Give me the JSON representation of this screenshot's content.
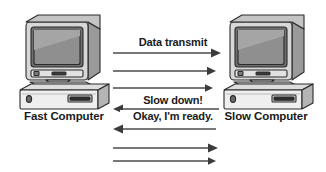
{
  "diagram": {
    "width": 326,
    "height": 172,
    "background_color": "#ffffff",
    "line_color": "#4a4a4a",
    "text_color": "#1a1a1a"
  },
  "nodes": [
    {
      "id": "fast-computer",
      "label": "Fast Computer",
      "icon": "desktop-computer-icon",
      "side": "left"
    },
    {
      "id": "slow-computer",
      "label": "Slow Computer",
      "icon": "desktop-computer-icon",
      "side": "right"
    }
  ],
  "messages": [
    {
      "id": "msg-1",
      "label": "Data transmit",
      "direction": "right",
      "y": 53
    },
    {
      "id": "msg-2",
      "label": "",
      "direction": "right",
      "y": 71
    },
    {
      "id": "msg-3",
      "label": "",
      "direction": "right",
      "y": 88
    },
    {
      "id": "msg-4",
      "label": "Slow down!",
      "direction": "left",
      "y": 109
    },
    {
      "id": "msg-5",
      "label": "Okay, I'm ready.",
      "direction": "left",
      "y": 129
    },
    {
      "id": "msg-6",
      "label": "",
      "direction": "right",
      "y": 148
    },
    {
      "id": "msg-7",
      "label": "",
      "direction": "right",
      "y": 161
    }
  ],
  "labels": {
    "data_transmit": "Data transmit",
    "slow_down": "Slow down!",
    "okay_ready": "Okay, I'm ready."
  },
  "colors": {
    "line": "#4a4a4a",
    "arrowhead": "#3c3c3c",
    "screen": "#8f8f8f",
    "case_light": "#e8e8e8",
    "case_mid": "#c9c9c9",
    "case_dark": "#9a9a9a",
    "outline": "#2b2b2b"
  }
}
